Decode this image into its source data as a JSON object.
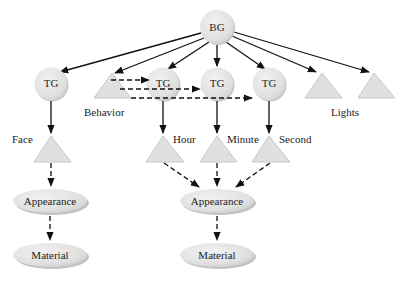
{
  "diagram": {
    "type": "scene-graph",
    "colors": {
      "node_fill": "#e3e3e3",
      "node_shadow": "#b8b8b8",
      "edge": "#111111",
      "text": "#222222"
    },
    "nodes": {
      "bg": {
        "label": "BG",
        "shape": "circle"
      },
      "tg_face": {
        "label": "TG",
        "shape": "circle"
      },
      "tg_hour": {
        "label": "TG",
        "shape": "circle"
      },
      "tg_minute": {
        "label": "TG",
        "shape": "circle"
      },
      "tg_second": {
        "label": "TG",
        "shape": "circle"
      },
      "behavior": {
        "label": "Behavior",
        "shape": "triangle"
      },
      "light1": {
        "label": "",
        "shape": "triangle"
      },
      "light2": {
        "label": "",
        "shape": "triangle"
      },
      "lights_label": "Lights",
      "face": {
        "label": "Face",
        "shape": "triangle"
      },
      "hour": {
        "label": "Hour",
        "shape": "triangle"
      },
      "minute": {
        "label": "Minute",
        "shape": "triangle"
      },
      "second": {
        "label": "Second",
        "shape": "triangle"
      },
      "appearance_left": {
        "label": "Appearance",
        "shape": "ellipse"
      },
      "appearance_right": {
        "label": "Appearance",
        "shape": "ellipse"
      },
      "material_left": {
        "label": "Material",
        "shape": "ellipse"
      },
      "material_right": {
        "label": "Material",
        "shape": "ellipse"
      }
    },
    "edges": [
      {
        "from": "BG",
        "to": "TG (Face)",
        "style": "solid"
      },
      {
        "from": "BG",
        "to": "Behavior",
        "style": "solid"
      },
      {
        "from": "BG",
        "to": "TG (Hour)",
        "style": "solid"
      },
      {
        "from": "BG",
        "to": "TG (Minute)",
        "style": "solid"
      },
      {
        "from": "BG",
        "to": "TG (Second)",
        "style": "solid"
      },
      {
        "from": "BG",
        "to": "Light 1",
        "style": "solid"
      },
      {
        "from": "BG",
        "to": "Light 2",
        "style": "solid"
      },
      {
        "from": "Behavior",
        "to": "TG (Hour)",
        "style": "dashed"
      },
      {
        "from": "Behavior",
        "to": "TG (Minute)",
        "style": "dashed"
      },
      {
        "from": "Behavior",
        "to": "TG (Second)",
        "style": "dashed"
      },
      {
        "from": "TG (Face)",
        "to": "Face",
        "style": "solid"
      },
      {
        "from": "TG (Hour)",
        "to": "Hour",
        "style": "solid"
      },
      {
        "from": "TG (Minute)",
        "to": "Minute",
        "style": "solid"
      },
      {
        "from": "TG (Second)",
        "to": "Second",
        "style": "solid"
      },
      {
        "from": "Face",
        "to": "Appearance (left)",
        "style": "dashed"
      },
      {
        "from": "Hour",
        "to": "Appearance (right)",
        "style": "dashed"
      },
      {
        "from": "Minute",
        "to": "Appearance (right)",
        "style": "dashed"
      },
      {
        "from": "Second",
        "to": "Appearance (right)",
        "style": "dashed"
      },
      {
        "from": "Appearance (left)",
        "to": "Material (left)",
        "style": "dashed"
      },
      {
        "from": "Appearance (right)",
        "to": "Material (right)",
        "style": "dashed"
      }
    ]
  }
}
